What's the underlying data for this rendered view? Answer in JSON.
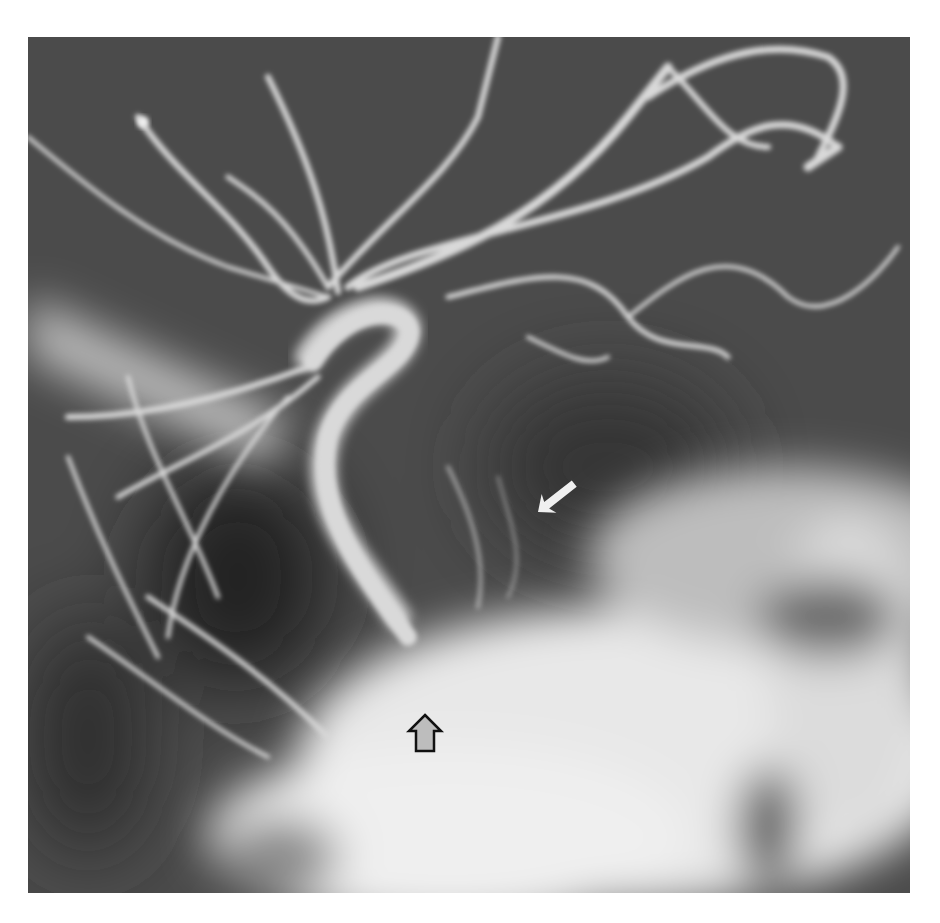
{
  "image": {
    "type": "cerebral angiogram (grayscale radiograph)",
    "colors": {
      "background": "#ffffff",
      "field": "#4a4a4a",
      "vessel": "#d8d8d8",
      "bone": "#f2f2f2",
      "dark_region": "#2a2a2a"
    }
  },
  "annotations": {
    "white_arrow": {
      "label": "white-arrow",
      "direction": "down-left",
      "color": "#f0f0f0"
    },
    "open_arrow": {
      "label": "open-arrow",
      "direction": "up",
      "fill": "#bdbdbd",
      "stroke": "#111111"
    }
  }
}
